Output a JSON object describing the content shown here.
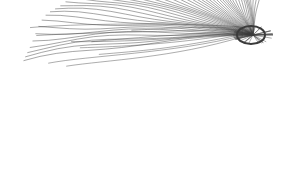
{
  "image": {
    "description": "Line-art wireframe of a fan/wing-like shape; dense strokes converge at a hub in the upper right, sweeping down-left to a scalloped lower edge",
    "background": "#ffffff",
    "stroke_color": "#3a3a3a",
    "hub": {
      "x": 253,
      "y": 35
    },
    "extent": {
      "left": 22,
      "top": 18,
      "right": 272,
      "bottom": 165
    }
  }
}
